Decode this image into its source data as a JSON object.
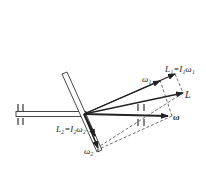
{
  "diagram": {
    "type": "physics-vector-diagram",
    "labels": {
      "omega1": "ω₁",
      "L1": "L₁=I₁ω₁",
      "L": "L",
      "omega": "ω",
      "L2": "L₂=I₂ω₂",
      "omega2": "ω₂"
    },
    "colors": {
      "ink": "#222222",
      "background": "#ffffff"
    }
  }
}
